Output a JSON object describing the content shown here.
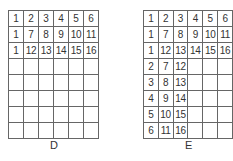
{
  "grids": [
    {
      "label": "D",
      "rows": [
        [
          "1",
          "2",
          "3",
          "4",
          "5",
          "6"
        ],
        [
          "1",
          "7",
          "8",
          "9",
          "10",
          "11"
        ],
        [
          "1",
          "12",
          "13",
          "14",
          "15",
          "16"
        ],
        [
          "",
          "",
          "",
          "",
          "",
          ""
        ],
        [
          "",
          "",
          "",
          "",
          "",
          ""
        ],
        [
          "",
          "",
          "",
          "",
          "",
          ""
        ],
        [
          "",
          "",
          "",
          "",
          "",
          ""
        ],
        [
          "",
          "",
          "",
          "",
          "",
          ""
        ]
      ]
    },
    {
      "label": "E",
      "rows": [
        [
          "1",
          "2",
          "3",
          "4",
          "5",
          "6"
        ],
        [
          "1",
          "7",
          "8",
          "9",
          "10",
          "11"
        ],
        [
          "1",
          "12",
          "13",
          "14",
          "15",
          "16"
        ],
        [
          "2",
          "7",
          "12",
          "",
          "",
          ""
        ],
        [
          "3",
          "8",
          "13",
          "",
          "",
          ""
        ],
        [
          "4",
          "9",
          "14",
          "",
          "",
          ""
        ],
        [
          "5",
          "10",
          "15",
          "",
          "",
          ""
        ],
        [
          "6",
          "11",
          "16",
          "",
          "",
          ""
        ]
      ]
    }
  ]
}
